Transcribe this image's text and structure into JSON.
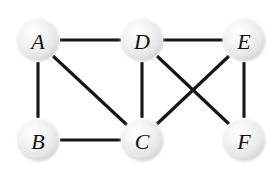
{
  "figure": {
    "type": "node-link-diagram",
    "background_color": "#ffffff",
    "width": 279,
    "height": 173
  },
  "style": {
    "edge_color": "#151515",
    "edge_width": 3.1,
    "node_radius": 21.5,
    "node_fill_light": "#fdfdfd",
    "node_fill_mid": "#eaeaea",
    "node_fill_edge": "#c9c9c9",
    "label_color": "#111111",
    "label_font_size": 22
  },
  "graph": {
    "node_count": 6,
    "edge_count": 9,
    "nodes": [
      {
        "id": "A",
        "label": "A",
        "x": 38,
        "y": 40,
        "r": 21.5
      },
      {
        "id": "D",
        "label": "D",
        "x": 142,
        "y": 40,
        "r": 21.5
      },
      {
        "id": "E",
        "label": "E",
        "x": 244,
        "y": 40,
        "r": 21.5
      },
      {
        "id": "B",
        "label": "B",
        "x": 38,
        "y": 140,
        "r": 21.5
      },
      {
        "id": "C",
        "label": "C",
        "x": 142,
        "y": 140,
        "r": 21.5
      },
      {
        "id": "F",
        "label": "F",
        "x": 244,
        "y": 140,
        "r": 21.5
      }
    ],
    "edges": [
      {
        "id": "A-D",
        "from": "A",
        "to": "D",
        "x1": 60,
        "y1": 40,
        "x2": 121,
        "y2": 40
      },
      {
        "id": "D-E",
        "from": "D",
        "to": "E",
        "x1": 163,
        "y1": 40,
        "x2": 223,
        "y2": 40
      },
      {
        "id": "A-B",
        "from": "A",
        "to": "B",
        "x1": 38,
        "y1": 62,
        "x2": 38,
        "y2": 118
      },
      {
        "id": "A-C",
        "from": "A",
        "to": "C",
        "x1": 53,
        "y1": 56,
        "x2": 127,
        "y2": 125
      },
      {
        "id": "B-C",
        "from": "B",
        "to": "C",
        "x1": 60,
        "y1": 140,
        "x2": 121,
        "y2": 140
      },
      {
        "id": "D-C",
        "from": "D",
        "to": "C",
        "x1": 142,
        "y1": 62,
        "x2": 142,
        "y2": 118
      },
      {
        "id": "D-F",
        "from": "D",
        "to": "F",
        "x1": 157,
        "y1": 56,
        "x2": 229,
        "y2": 124
      },
      {
        "id": "C-E",
        "from": "C",
        "to": "E",
        "x1": 157,
        "y1": 124,
        "x2": 229,
        "y2": 56
      },
      {
        "id": "E-F",
        "from": "E",
        "to": "F",
        "x1": 244,
        "y1": 62,
        "x2": 244,
        "y2": 118
      }
    ],
    "adjacency": {
      "A": [
        "B",
        "C",
        "D"
      ],
      "B": [
        "A",
        "C"
      ],
      "C": [
        "A",
        "B",
        "D",
        "E"
      ],
      "D": [
        "A",
        "C",
        "E",
        "F"
      ],
      "E": [
        "C",
        "D",
        "F"
      ],
      "F": [
        "D",
        "E"
      ]
    }
  }
}
